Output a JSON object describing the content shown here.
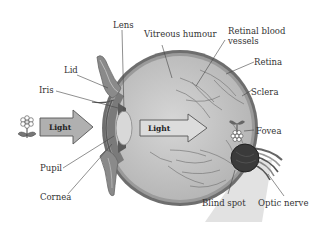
{
  "diagram": {
    "labels": {
      "lens": "Lens",
      "lid": "Lid",
      "iris": "Iris",
      "pupil": "Pupil",
      "cornea": "Cornea",
      "vitreous": "Vitreous humour",
      "retinal_vessels_1": "Retinal blood",
      "retinal_vessels_2": "vessels",
      "retina": "Retina",
      "sclera": "Sclera",
      "fovea": "Fovea",
      "blind_spot": "Blind spot",
      "optic_nerve": "Optic nerve"
    },
    "arrows": {
      "outside": "Light",
      "inside": "Light"
    },
    "colors": {
      "eyeball_fill": "#c9c9c9",
      "sclera": "#6e6e6e",
      "retina": "#9a9a9a",
      "arrow_fill": "#b8b8b8",
      "arrow_stroke": "#555555",
      "lens_fill": "#d8d8d8",
      "blind_spot": "#3a3a3a",
      "background": "#ffffff"
    }
  }
}
